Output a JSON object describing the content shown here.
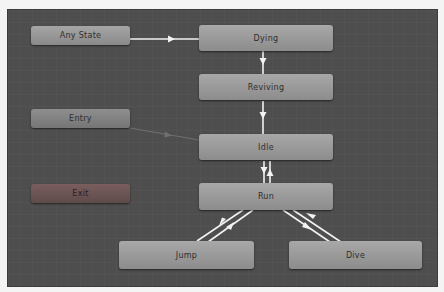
{
  "diagram": {
    "type": "animator-state-machine",
    "colors": {
      "canvas": "#4e4e4e",
      "node": "#9c9c9c",
      "exit_node": "#6c5252",
      "transition": "#f2f2f2"
    },
    "nodes": [
      {
        "id": "any_state",
        "label": "Any State"
      },
      {
        "id": "entry",
        "label": "Entry"
      },
      {
        "id": "exit",
        "label": "Exit"
      },
      {
        "id": "dying",
        "label": "Dying"
      },
      {
        "id": "reviving",
        "label": "Reviving"
      },
      {
        "id": "idle",
        "label": "Idle"
      },
      {
        "id": "run",
        "label": "Run"
      },
      {
        "id": "jump",
        "label": "Jump"
      },
      {
        "id": "dive",
        "label": "Dive"
      }
    ],
    "transitions": [
      {
        "from": "Any State",
        "to": "Dying"
      },
      {
        "from": "Dying",
        "to": "Reviving"
      },
      {
        "from": "Reviving",
        "to": "Idle"
      },
      {
        "from": "Entry",
        "to": "Idle",
        "style": "default"
      },
      {
        "from": "Idle",
        "to": "Run"
      },
      {
        "from": "Run",
        "to": "Idle"
      },
      {
        "from": "Run",
        "to": "Jump"
      },
      {
        "from": "Jump",
        "to": "Run"
      },
      {
        "from": "Run",
        "to": "Dive"
      },
      {
        "from": "Dive",
        "to": "Run"
      }
    ]
  }
}
